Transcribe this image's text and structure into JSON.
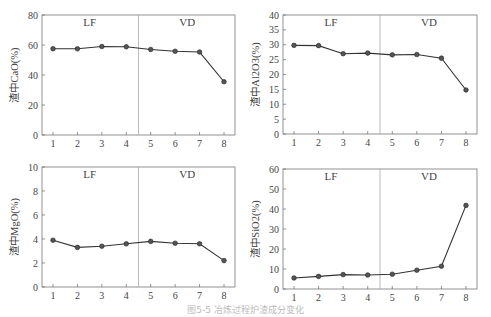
{
  "caption": "图5-5  冶炼过程炉渣成分变化",
  "chart_data": [
    {
      "type": "line",
      "ylabel": "渣中CaO(%)",
      "categories": [
        1,
        2,
        3,
        4,
        5,
        6,
        7,
        8
      ],
      "values": [
        57.5,
        57.5,
        59,
        58.8,
        57,
        55.8,
        55.3,
        35.5
      ],
      "ylim": [
        0,
        80
      ],
      "yticks": [
        0,
        20,
        40,
        60,
        80
      ],
      "regions": [
        {
          "label": "LF",
          "from": 1,
          "to": 4.5
        },
        {
          "label": "VD",
          "from": 4.5,
          "to": 8
        }
      ],
      "divider_x": 4.5,
      "grid": false
    },
    {
      "type": "line",
      "ylabel": "渣中Al2O3(%)",
      "categories": [
        1,
        2,
        3,
        4,
        5,
        6,
        7,
        8
      ],
      "values": [
        29.8,
        29.7,
        27,
        27.2,
        26.6,
        26.7,
        25.5,
        14.8
      ],
      "ylim": [
        0,
        40
      ],
      "yticks": [
        0,
        5,
        10,
        15,
        20,
        25,
        30,
        35,
        40
      ],
      "regions": [
        {
          "label": "LF",
          "from": 1,
          "to": 4.5
        },
        {
          "label": "VD",
          "from": 4.5,
          "to": 8
        }
      ],
      "divider_x": 4.5,
      "grid": false
    },
    {
      "type": "line",
      "ylabel": "渣中MgO(%)",
      "categories": [
        1,
        2,
        3,
        4,
        5,
        6,
        7,
        8
      ],
      "values": [
        3.9,
        3.3,
        3.4,
        3.6,
        3.8,
        3.65,
        3.6,
        2.2
      ],
      "ylim": [
        0,
        10
      ],
      "yticks": [
        0,
        2,
        4,
        6,
        8,
        10
      ],
      "regions": [
        {
          "label": "LF",
          "from": 1,
          "to": 4.5
        },
        {
          "label": "VD",
          "from": 4.5,
          "to": 8
        }
      ],
      "divider_x": 4.5,
      "grid": false
    },
    {
      "type": "line",
      "ylabel": "渣中SiO2(%)",
      "categories": [
        1,
        2,
        3,
        4,
        5,
        6,
        7,
        8
      ],
      "values": [
        5.5,
        6.3,
        7.2,
        7,
        7.4,
        9.4,
        11.4,
        41.8
      ],
      "ylim": [
        0,
        60
      ],
      "yticks": [
        0,
        10,
        20,
        30,
        40,
        50,
        60
      ],
      "regions": [
        {
          "label": "LF",
          "from": 1,
          "to": 4.5
        },
        {
          "label": "VD",
          "from": 4.5,
          "to": 8
        }
      ],
      "divider_x": 4.5,
      "grid": false
    }
  ],
  "layout": [
    {
      "x0": 42,
      "x1": 235,
      "y0": 15,
      "y1": 135
    },
    {
      "x0": 283,
      "x1": 477,
      "y0": 15,
      "y1": 134
    },
    {
      "x0": 42,
      "x1": 235,
      "y0": 167,
      "y1": 287
    },
    {
      "x0": 283,
      "x1": 477,
      "y0": 169,
      "y1": 289
    }
  ]
}
